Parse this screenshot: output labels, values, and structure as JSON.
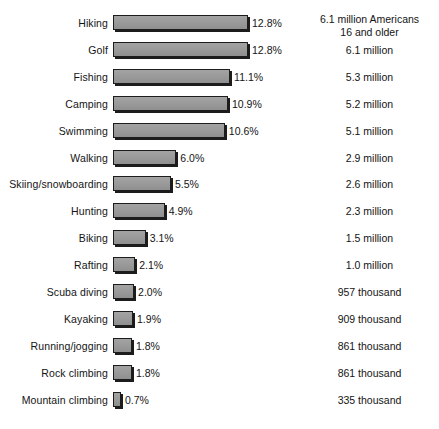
{
  "chart_data": {
    "type": "bar",
    "title": "",
    "subtitle": "",
    "xlabel": "",
    "ylabel": "",
    "orientation": "horizontal",
    "grid": false,
    "legend": null,
    "xlim": [
      0,
      12.8
    ],
    "value_suffix": "%",
    "categories": [
      "Hiking",
      "Golf",
      "Fishing",
      "Camping",
      "Swimming",
      "Walking",
      "Skiing/snowboarding",
      "Hunting",
      "Biking",
      "Rafting",
      "Scuba diving",
      "Kayaking",
      "Running/jogging",
      "Rock climbing",
      "Mountain climbing"
    ],
    "values": [
      12.8,
      12.8,
      11.1,
      10.9,
      10.6,
      6.0,
      5.5,
      4.9,
      3.1,
      2.1,
      2.0,
      1.9,
      1.8,
      1.8,
      0.7
    ],
    "value_labels": [
      "12.8%",
      "12.8%",
      "11.1%",
      "10.9%",
      "10.6%",
      "6.0%",
      "5.5%",
      "4.9%",
      "3.1%",
      "2.1%",
      "2.0%",
      "1.9%",
      "1.8%",
      "1.8%",
      "0.7%"
    ],
    "annotations_column_header": [
      "6.1 million Americans",
      "16 and older"
    ],
    "annotations": [
      "6.1 million",
      "6.1 million",
      "5.3 million",
      "5.2 million",
      "5.1 million",
      "2.9 million",
      "2.6 million",
      "2.3 million",
      "1.5 million",
      "1.0 million",
      "957 thousand",
      "909 thousand",
      "861 thousand",
      "861 thousand",
      "335 thousand"
    ],
    "colors": {
      "bar_fill": "#9b9b9b",
      "bar_outline": "#1c1c1c",
      "bar_shadow": "#1c1c1c",
      "text": "#141414",
      "background": "#ffffff"
    }
  },
  "rows": [
    {
      "label": "Hiking",
      "value": 12.8,
      "value_label": "12.8%",
      "amount_line1": "6.1 million Americans",
      "amount_line2": "16 and older"
    },
    {
      "label": "Golf",
      "value": 12.8,
      "value_label": "12.8%",
      "amount": "6.1 million"
    },
    {
      "label": "Fishing",
      "value": 11.1,
      "value_label": "11.1%",
      "amount": "5.3 million"
    },
    {
      "label": "Camping",
      "value": 10.9,
      "value_label": "10.9%",
      "amount": "5.2 million"
    },
    {
      "label": "Swimming",
      "value": 10.6,
      "value_label": "10.6%",
      "amount": "5.1 million"
    },
    {
      "label": "Walking",
      "value": 6.0,
      "value_label": "6.0%",
      "amount": "2.9 million"
    },
    {
      "label": "Skiing/snowboarding",
      "value": 5.5,
      "value_label": "5.5%",
      "amount": "2.6 million"
    },
    {
      "label": "Hunting",
      "value": 4.9,
      "value_label": "4.9%",
      "amount": "2.3 million"
    },
    {
      "label": "Biking",
      "value": 3.1,
      "value_label": "3.1%",
      "amount": "1.5 million"
    },
    {
      "label": "Rafting",
      "value": 2.1,
      "value_label": "2.1%",
      "amount": "1.0 million"
    },
    {
      "label": "Scuba diving",
      "value": 2.0,
      "value_label": "2.0%",
      "amount": "957 thousand"
    },
    {
      "label": "Kayaking",
      "value": 1.9,
      "value_label": "1.9%",
      "amount": "909 thousand"
    },
    {
      "label": "Running/jogging",
      "value": 1.8,
      "value_label": "1.8%",
      "amount": "861 thousand"
    },
    {
      "label": "Rock climbing",
      "value": 1.8,
      "value_label": "1.8%",
      "amount": "861 thousand"
    },
    {
      "label": "Mountain climbing",
      "value": 0.7,
      "value_label": "0.7%",
      "amount": "335 thousand"
    }
  ],
  "layout": {
    "first_row_top": 12,
    "row_pitch": 26.9,
    "bar_origin_x": 113,
    "px_per_percent": 10.55,
    "min_bar_px": 8
  }
}
